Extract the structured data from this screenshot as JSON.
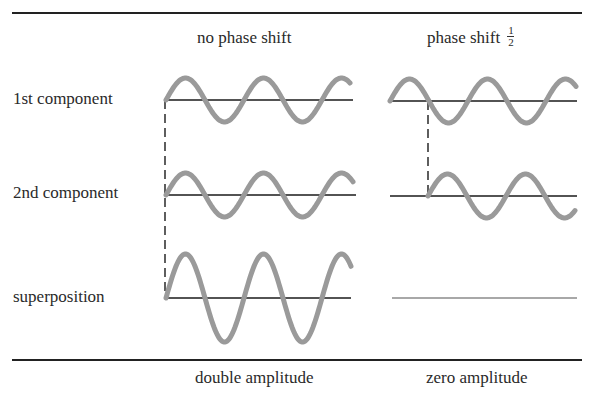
{
  "columns": {
    "left": {
      "header": "no phase shift",
      "footer": "double amplitude"
    },
    "right": {
      "header": "phase shift",
      "fraction_num": "1",
      "fraction_den": "2",
      "footer": "zero amplitude"
    }
  },
  "rows": [
    {
      "label": "1st component"
    },
    {
      "label": "2nd component"
    },
    {
      "label": "superposition"
    }
  ],
  "colors": {
    "wave": "#9a9a9a",
    "axis": "#1a1a1a",
    "flat": "#a8a8a8"
  }
}
